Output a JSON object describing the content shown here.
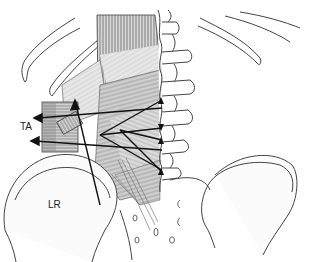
{
  "figure": {
    "labels": {
      "ta": "TA",
      "lr": "LR"
    },
    "colors": {
      "line": "#333333",
      "muscle_fill": "#b8b8b8",
      "muscle_dark": "#7a7a7a",
      "bone_fill": "#ffffff",
      "background": "#ffffff"
    }
  }
}
